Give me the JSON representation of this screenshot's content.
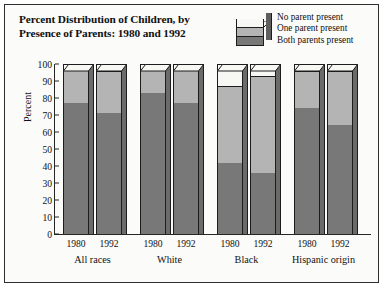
{
  "title": {
    "line1": "Percent Distribution of Children, by",
    "line2": "Presence of Parents: 1980 and 1992"
  },
  "legend": {
    "items": [
      {
        "label": "No parent present",
        "color": "#f7f7f3"
      },
      {
        "label": "One parent present",
        "color": "#b4b4b4"
      },
      {
        "label": "Both parents present",
        "color": "#787878"
      }
    ]
  },
  "axis": {
    "ylabel": "Percent",
    "yticks": [
      "0",
      "10",
      "20",
      "30",
      "40",
      "50",
      "60",
      "70",
      "80",
      "90",
      "100"
    ]
  },
  "chart_data": {
    "type": "bar",
    "title": "Percent Distribution of Children, by Presence of Parents: 1980 and 1992",
    "xlabel": "",
    "ylabel": "Percent",
    "ylim": [
      0,
      100
    ],
    "grid": false,
    "stacked": true,
    "legend_position": "top-right",
    "groups": [
      "All races",
      "White",
      "Black",
      "Hispanic origin"
    ],
    "categories": [
      "All races 1980",
      "All races 1992",
      "White 1980",
      "White 1992",
      "Black 1980",
      "Black 1992",
      "Hispanic origin 1980",
      "Hispanic origin 1992"
    ],
    "years": [
      "1980",
      "1992",
      "1980",
      "1992",
      "1980",
      "1992",
      "1980",
      "1992"
    ],
    "series": [
      {
        "name": "Both parents present",
        "values": [
          77,
          71,
          83,
          77,
          42,
          36,
          74,
          64
        ]
      },
      {
        "name": "One parent present",
        "values": [
          20,
          25,
          14,
          20,
          45,
          57,
          22,
          32
        ]
      },
      {
        "name": "No parent present",
        "values": [
          3,
          4,
          3,
          3,
          13,
          7,
          4,
          4
        ]
      }
    ],
    "cumulative_tops": {
      "both_parents": [
        77,
        71,
        83,
        77,
        42,
        36,
        74,
        64
      ],
      "plus_one": [
        97,
        96,
        97,
        97,
        87,
        93,
        96,
        96
      ]
    }
  }
}
